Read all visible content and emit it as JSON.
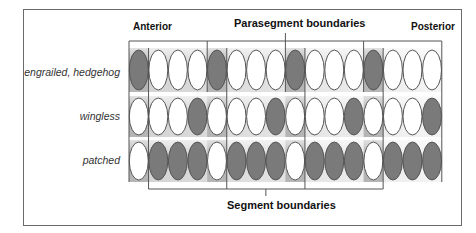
{
  "diagram": {
    "labels": {
      "anterior": "Anterior",
      "posterior": "Posterior",
      "parasegment_boundaries": "Parasegment boundaries",
      "segment_boundaries": "Segment boundaries"
    },
    "rows": [
      {
        "name": "engrailed, hedgehog",
        "pattern": [
          1,
          0,
          0,
          0,
          1,
          0,
          0,
          0,
          1,
          0,
          0,
          0,
          1,
          0,
          0,
          0
        ]
      },
      {
        "name": "wingless",
        "pattern": [
          0,
          0,
          0,
          1,
          0,
          0,
          0,
          1,
          0,
          0,
          0,
          1,
          0,
          0,
          0,
          1
        ]
      },
      {
        "name": "patched",
        "pattern": [
          0,
          1,
          1,
          1,
          0,
          1,
          1,
          1,
          0,
          1,
          1,
          1,
          0,
          1,
          1,
          1
        ]
      }
    ],
    "colors": {
      "filled_cell": "#7a7a7a",
      "empty_cell": "#ffffff",
      "cell_outline": "#555555",
      "band_dark": "#b5b5b5",
      "band_light": "#e6e6e6",
      "line": "#555555"
    }
  }
}
